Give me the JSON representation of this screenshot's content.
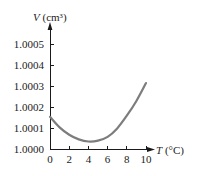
{
  "chart_data": {
    "type": "line",
    "title": "",
    "xlabel": "T (°C)",
    "ylabel": "V (cm³)",
    "xlabel_var": "T",
    "xlabel_unit": " (°C)",
    "ylabel_var": "V",
    "ylabel_unit": " (cm³)",
    "xlim": [
      0,
      10
    ],
    "ylim": [
      1.0,
      1.0005
    ],
    "x_ticks": [
      0,
      2,
      4,
      6,
      8,
      10
    ],
    "x_tick_labels": [
      "0",
      "2",
      "4",
      "6",
      "8",
      "10"
    ],
    "y_ticks": [
      1.0,
      1.0001,
      1.0002,
      1.0003,
      1.0004,
      1.0005
    ],
    "y_tick_labels": [
      "1.0000",
      "1.0001",
      "1.0002",
      "1.0003",
      "1.0004",
      "1.0005"
    ],
    "grid": false,
    "legend": null,
    "series": [
      {
        "name": "Volume of 1 g of water",
        "color": "#7d7d7d",
        "x": [
          0,
          1,
          2,
          3,
          4,
          5,
          6,
          7,
          8,
          9,
          10
        ],
        "values": [
          1.000155,
          1.000105,
          1.00007,
          1.000048,
          1.000038,
          1.000042,
          1.00006,
          1.0001,
          1.00016,
          1.00023,
          1.000315
        ]
      }
    ]
  }
}
